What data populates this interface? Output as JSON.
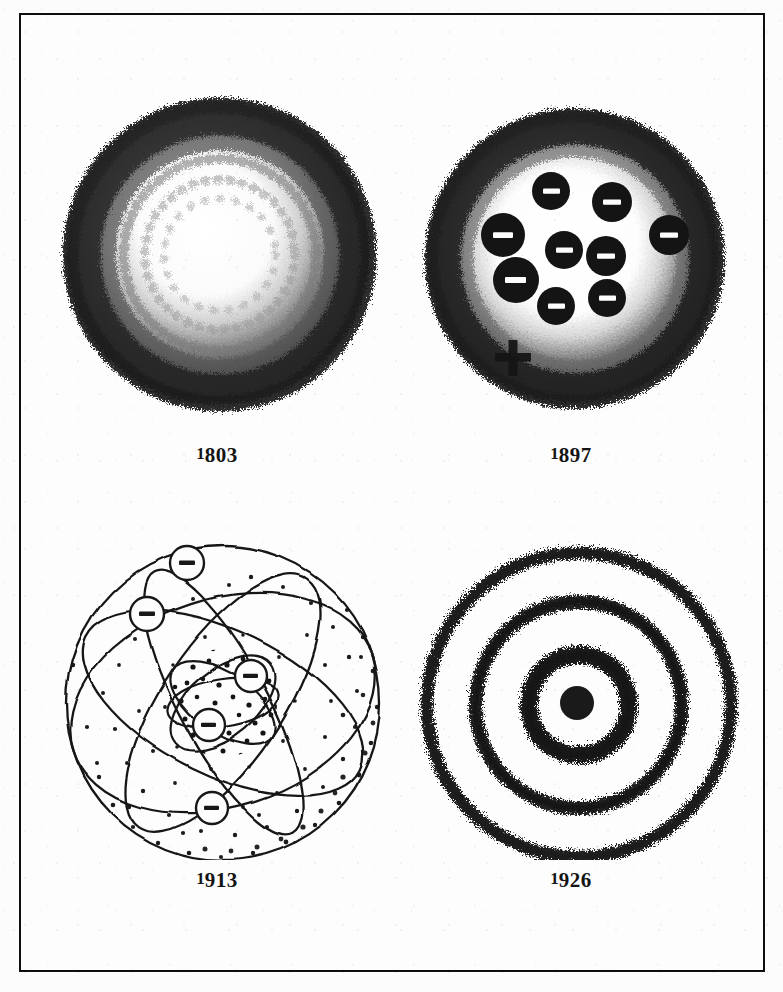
{
  "plate": {
    "title": "Historical models of the atom",
    "background_color": "#fdfdfd",
    "ink_color": "#141414",
    "frame": {
      "border_color": "#111111",
      "border_width_px": 2
    }
  },
  "figures": [
    {
      "id": "dalton",
      "label": "1803",
      "label_lead": "1",
      "label_rest": "803",
      "model_name": "solid-sphere-model",
      "description": "Dalton solid sphere: textured dark annulus with lighter core",
      "center": {
        "x": 224,
        "y": 275
      },
      "radius": 164,
      "shell_count": 1,
      "electrons": [],
      "nucleus": false,
      "plus_marker": false
    },
    {
      "id": "thomson",
      "label": "1897",
      "label_lead": "1",
      "label_rest": "897",
      "model_name": "plum-pudding-model",
      "description": "Thomson plum pudding: nine negative corpuscles embedded in a positive cloud",
      "center": {
        "x": 570,
        "y": 278
      },
      "radius": 155,
      "electron_count": 9,
      "electrons": [
        {
          "x": 548,
          "y": 212,
          "r": 19
        },
        {
          "x": 609,
          "y": 223,
          "r": 20
        },
        {
          "x": 500,
          "y": 256,
          "r": 22
        },
        {
          "x": 561,
          "y": 271,
          "r": 19
        },
        {
          "x": 603,
          "y": 277,
          "r": 20
        },
        {
          "x": 666,
          "y": 256,
          "r": 20
        },
        {
          "x": 513,
          "y": 301,
          "r": 23
        },
        {
          "x": 553,
          "y": 327,
          "r": 19
        },
        {
          "x": 604,
          "y": 319,
          "r": 19
        }
      ],
      "plus_marker": {
        "x": 508,
        "y": 378,
        "size": 34,
        "stroke": 8
      },
      "nucleus": false
    },
    {
      "id": "bohr",
      "label": "1913",
      "label_lead": "1",
      "label_rest": "913",
      "model_name": "planetary-orbit-model",
      "description": "Bohr / Rutherford planetary model: five electrons on elliptical orbits around a stippled nucleus",
      "center": {
        "x": 222,
        "y": 700
      },
      "radius": 158,
      "electron_count": 5,
      "electrons": [
        {
          "x": 186,
          "y": 560,
          "r": 17
        },
        {
          "x": 146,
          "y": 611,
          "r": 17
        },
        {
          "x": 250,
          "y": 673,
          "r": 16
        },
        {
          "x": 208,
          "y": 722,
          "r": 16
        },
        {
          "x": 211,
          "y": 805,
          "r": 16
        }
      ],
      "orbit_count": 5,
      "nucleus": {
        "x": 222,
        "y": 700,
        "r": 52,
        "style": "stippled"
      },
      "stipple": true,
      "plus_marker": false
    },
    {
      "id": "quantum",
      "label": "1926",
      "label_lead": "1",
      "label_rest": "926",
      "model_name": "electron-cloud-model",
      "description": "Quantum / electron-cloud model: three diffuse concentric shells around a solid nucleus",
      "center": {
        "x": 586,
        "y": 700
      },
      "shell_count": 3,
      "shell_radii": [
        50,
        103,
        152
      ],
      "nucleus": {
        "x": 586,
        "y": 700,
        "r": 17,
        "style": "solid"
      },
      "electrons": [],
      "plus_marker": false
    }
  ],
  "labels": {
    "dalton": "1803",
    "thomson": "1897",
    "bohr": "1913",
    "quantum": "1926"
  }
}
